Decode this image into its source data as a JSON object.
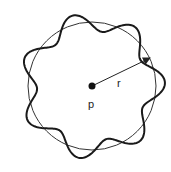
{
  "diagram": {
    "center": {
      "label": "p",
      "x": 92,
      "y": 86
    },
    "circle": {
      "radius": 64,
      "stroke": "#333333"
    },
    "radius_arrow": {
      "label": "r",
      "to_x": 150,
      "to_y": 58
    },
    "wave": {
      "lobes": 7,
      "amplitude": 9,
      "phase": 1.9,
      "stroke": "#1a1a1a"
    }
  }
}
